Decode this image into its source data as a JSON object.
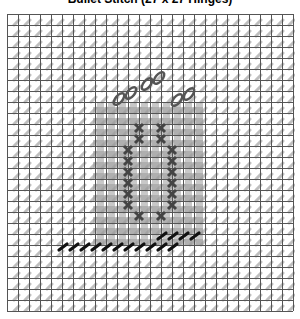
{
  "title": "Bullet Stitch (27 x 27 Hinges)",
  "grid": {
    "cols": 26,
    "rows": 27,
    "cell": 11,
    "line_color": "#555555",
    "bg_mark_color": "#b0b0b0"
  },
  "fill_region": {
    "x": 88,
    "y": 91,
    "w": 110,
    "h": 143,
    "color": "#9a9a9a"
  },
  "dark_crosses": [
    [
      132,
      114
    ],
    [
      154,
      114
    ],
    [
      132,
      125
    ],
    [
      154,
      125
    ],
    [
      121,
      136
    ],
    [
      165,
      136
    ],
    [
      121,
      147
    ],
    [
      165,
      147
    ],
    [
      121,
      158
    ],
    [
      165,
      158
    ],
    [
      121,
      169
    ],
    [
      165,
      169
    ],
    [
      121,
      180
    ],
    [
      165,
      180
    ],
    [
      121,
      191
    ],
    [
      165,
      191
    ],
    [
      132,
      202
    ],
    [
      154,
      202
    ]
  ],
  "loops": [
    {
      "x": 118,
      "y": 81
    },
    {
      "x": 146,
      "y": 66
    },
    {
      "x": 176,
      "y": 82
    }
  ],
  "half_stitches_bottom": {
    "start_x": 56,
    "y": 233,
    "count": 11,
    "step": 11
  },
  "half_stitches_top": {
    "start_x": 155,
    "y": 222,
    "count": 4,
    "step": 11
  },
  "colors": {
    "dark": "#111111",
    "cross": "#444444",
    "loop": "#555555"
  }
}
